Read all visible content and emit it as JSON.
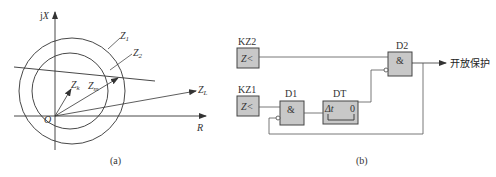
{
  "figure_a": {
    "caption": "(a)",
    "axes": {
      "y_label": "jX",
      "x_label": "R",
      "origin_label": "O"
    },
    "circles": [
      {
        "name": "Z1",
        "label": "Z",
        "sub": "1"
      },
      {
        "name": "Z2",
        "label": "Z",
        "sub": "2"
      }
    ],
    "vectors": [
      {
        "name": "Zk",
        "label": "Z",
        "sub": "k"
      },
      {
        "name": "Zm",
        "label": "Z",
        "sub": "m"
      },
      {
        "name": "ZL",
        "label": "Z",
        "sub": "L"
      }
    ]
  },
  "figure_b": {
    "caption": "(b)",
    "blocks": {
      "kz2": {
        "name": "KZ2",
        "symbol": "Z<"
      },
      "kz1": {
        "name": "KZ1",
        "symbol": "Z<"
      },
      "d1": {
        "name": "D1",
        "symbol": "&"
      },
      "dt": {
        "name": "DT",
        "symbol_left": "Δt",
        "symbol_right": "0"
      },
      "d2": {
        "name": "D2",
        "symbol": "&"
      }
    },
    "output_label": "开放保护"
  },
  "colors": {
    "line": "#333333",
    "block_fill": "#c8c8c8",
    "block_stroke": "#444444"
  }
}
